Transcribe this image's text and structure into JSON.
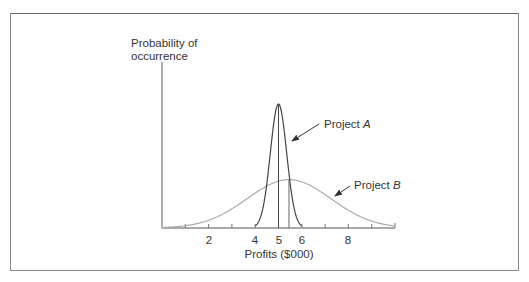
{
  "chart_data": {
    "type": "line",
    "title": "",
    "ylabel": "Probability of occurrence",
    "ylabel_lines": [
      "Probability of",
      "occurrence"
    ],
    "xlabel": "Profits ($000)",
    "x_ticks": [
      1,
      2,
      3,
      4,
      5,
      6,
      7,
      8,
      9
    ],
    "x_tick_labels": [
      "2",
      "4",
      "5",
      "6",
      "8"
    ],
    "x_tick_label_values": [
      2,
      4,
      5,
      6,
      8
    ],
    "xlim": [
      0,
      10
    ],
    "grid": false,
    "legend": "none (inline annotations)",
    "series": [
      {
        "name": "Project A",
        "distribution": "normal",
        "mean": 5,
        "sd": 0.35,
        "relative_peak": 1.0,
        "color": "#444444",
        "mean_line": true
      },
      {
        "name": "Project B",
        "distribution": "normal",
        "mean": 5.45,
        "sd": 1.8,
        "relative_peak": 0.39,
        "color": "#aaaaaa",
        "mean_line": true
      }
    ],
    "annotations": [
      {
        "text": "Project A",
        "italic_part": "A",
        "points_to": "Project A curve"
      },
      {
        "text": "Project B",
        "italic_part": "B",
        "points_to": "Project B curve"
      }
    ]
  },
  "labels": {
    "ylabel_line1": "Probability of",
    "ylabel_line2": "occurrence",
    "xlabel": "Profits ($000)",
    "tick_2": "2",
    "tick_4": "4",
    "tick_5": "5",
    "tick_6": "6",
    "tick_8": "8",
    "projA_prefix": "Project ",
    "projA_letter": "A",
    "projB_prefix": "Project ",
    "projB_letter": "B"
  }
}
